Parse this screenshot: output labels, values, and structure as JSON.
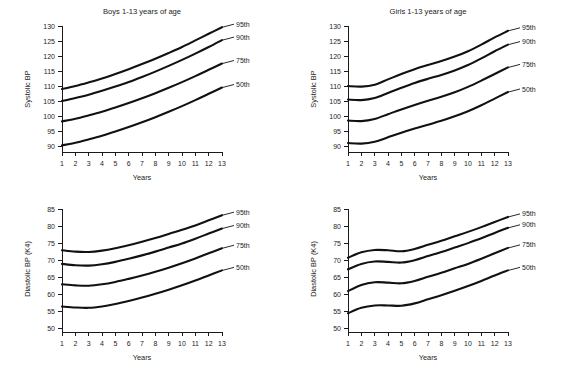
{
  "figure": {
    "background_color": "#ffffff",
    "curve_color": "#111111",
    "text_color": "#1d1d1d",
    "panel_count": 4
  },
  "chart_data": [
    {
      "id": "boys-systolic",
      "type": "line",
      "title": "Boys 1-13 years of age",
      "xlabel": "Years",
      "ylabel": "Systolic BP",
      "xlim": [
        1,
        13
      ],
      "ylim": [
        88,
        130
      ],
      "grid": false,
      "legend_position": "right-end-labels",
      "xticks": [
        1,
        2,
        3,
        4,
        5,
        6,
        7,
        8,
        9,
        10,
        11,
        12,
        13
      ],
      "yticks": [
        90,
        95,
        100,
        105,
        110,
        115,
        120,
        125,
        130
      ],
      "x": [
        1,
        2,
        3,
        4,
        5,
        6,
        7,
        8,
        9,
        10,
        11,
        12,
        13
      ],
      "series": [
        {
          "name": "95th",
          "values": [
            109.0,
            110.0,
            111.2,
            112.5,
            114.0,
            115.6,
            117.3,
            119.1,
            121.0,
            123.0,
            125.2,
            127.4,
            129.6
          ]
        },
        {
          "name": "90th",
          "values": [
            105.0,
            106.0,
            107.1,
            108.4,
            109.8,
            111.3,
            113.0,
            114.8,
            116.7,
            118.7,
            120.8,
            123.0,
            125.3
          ]
        },
        {
          "name": "75th",
          "values": [
            98.2,
            99.1,
            100.2,
            101.4,
            102.8,
            104.3,
            105.9,
            107.6,
            109.4,
            111.3,
            113.3,
            115.4,
            117.5
          ]
        },
        {
          "name": "50th",
          "values": [
            90.2,
            91.1,
            92.2,
            93.4,
            94.8,
            96.3,
            97.9,
            99.6,
            101.4,
            103.3,
            105.3,
            107.4,
            109.5
          ]
        }
      ]
    },
    {
      "id": "girls-systolic",
      "type": "line",
      "title": "Girls 1-13 years of age",
      "xlabel": "Years",
      "ylabel": "Systolic BP",
      "xlim": [
        1,
        13
      ],
      "ylim": [
        88,
        130
      ],
      "grid": false,
      "legend_position": "right-end-labels",
      "xticks": [
        1,
        2,
        3,
        4,
        5,
        6,
        7,
        8,
        9,
        10,
        11,
        12,
        13
      ],
      "yticks": [
        90,
        95,
        100,
        105,
        110,
        115,
        120,
        125,
        130
      ],
      "x": [
        1,
        2,
        3,
        4,
        5,
        6,
        7,
        8,
        9,
        10,
        11,
        12,
        13
      ],
      "series": [
        {
          "name": "95th",
          "values": [
            110.0,
            109.8,
            110.4,
            112.2,
            114.0,
            115.6,
            117.0,
            118.3,
            119.8,
            121.6,
            123.8,
            126.2,
            128.4
          ]
        },
        {
          "name": "90th",
          "values": [
            105.5,
            105.3,
            106.0,
            107.7,
            109.4,
            111.0,
            112.4,
            113.7,
            115.2,
            117.0,
            119.2,
            121.6,
            123.8
          ]
        },
        {
          "name": "75th",
          "values": [
            98.5,
            98.3,
            99.0,
            100.6,
            102.2,
            103.7,
            105.1,
            106.4,
            107.9,
            109.7,
            111.8,
            114.0,
            116.2
          ]
        },
        {
          "name": "50th",
          "values": [
            91.0,
            90.8,
            91.4,
            92.9,
            94.4,
            95.8,
            97.1,
            98.4,
            99.9,
            101.6,
            103.6,
            105.8,
            108.0
          ]
        }
      ]
    },
    {
      "id": "boys-diastolic",
      "type": "line",
      "title": "",
      "xlabel": "Years",
      "ylabel": "Diastolic BP (K4)",
      "xlim": [
        1,
        13
      ],
      "ylim": [
        49,
        86
      ],
      "grid": false,
      "legend_position": "right-end-labels",
      "xticks": [
        1,
        2,
        3,
        4,
        5,
        6,
        7,
        8,
        9,
        10,
        11,
        12,
        13
      ],
      "yticks": [
        50,
        55,
        60,
        65,
        70,
        75,
        80,
        85
      ],
      "x": [
        1,
        2,
        3,
        4,
        5,
        6,
        7,
        8,
        9,
        10,
        11,
        12,
        13
      ],
      "series": [
        {
          "name": "95th",
          "values": [
            73.0,
            72.6,
            72.5,
            72.9,
            73.6,
            74.5,
            75.5,
            76.6,
            77.8,
            79.0,
            80.3,
            81.8,
            83.3
          ]
        },
        {
          "name": "90th",
          "values": [
            69.0,
            68.6,
            68.5,
            68.9,
            69.6,
            70.5,
            71.5,
            72.6,
            73.8,
            75.0,
            76.4,
            77.9,
            79.4
          ]
        },
        {
          "name": "75th",
          "values": [
            63.0,
            62.7,
            62.6,
            63.0,
            63.7,
            64.6,
            65.6,
            66.7,
            67.9,
            69.2,
            70.6,
            72.1,
            73.6
          ]
        },
        {
          "name": "50th",
          "values": [
            56.5,
            56.2,
            56.1,
            56.5,
            57.2,
            58.1,
            59.1,
            60.2,
            61.4,
            62.7,
            64.1,
            65.6,
            67.1
          ]
        }
      ]
    },
    {
      "id": "girls-diastolic",
      "type": "line",
      "title": "",
      "xlabel": "Years",
      "ylabel": "Diastolic BP (K4)",
      "xlim": [
        1,
        13
      ],
      "ylim": [
        49,
        86
      ],
      "grid": false,
      "legend_position": "right-end-labels",
      "xticks": [
        1,
        2,
        3,
        4,
        5,
        6,
        7,
        8,
        9,
        10,
        11,
        12,
        13
      ],
      "yticks": [
        50,
        55,
        60,
        65,
        70,
        75,
        80,
        85
      ],
      "x": [
        1,
        2,
        3,
        4,
        5,
        6,
        7,
        8,
        9,
        10,
        11,
        12,
        13
      ],
      "series": [
        {
          "name": "95th",
          "values": [
            70.8,
            72.4,
            73.1,
            73.0,
            72.7,
            73.4,
            74.6,
            75.8,
            77.1,
            78.4,
            79.8,
            81.3,
            82.8
          ]
        },
        {
          "name": "90th",
          "values": [
            67.4,
            69.0,
            69.7,
            69.6,
            69.4,
            70.1,
            71.3,
            72.5,
            73.8,
            75.1,
            76.5,
            78.1,
            79.6
          ]
        },
        {
          "name": "75th",
          "values": [
            61.0,
            62.8,
            63.6,
            63.5,
            63.3,
            64.0,
            65.2,
            66.4,
            67.7,
            69.0,
            70.5,
            72.1,
            73.7
          ]
        },
        {
          "name": "50th",
          "values": [
            54.5,
            56.1,
            56.8,
            56.8,
            56.7,
            57.4,
            58.6,
            59.8,
            61.1,
            62.5,
            64.0,
            65.6,
            67.1
          ]
        }
      ]
    }
  ]
}
